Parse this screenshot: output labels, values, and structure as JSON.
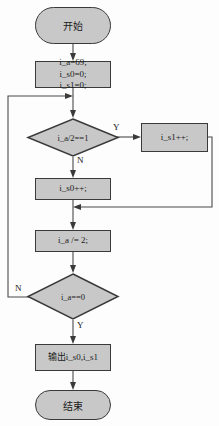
{
  "diagram": {
    "type": "flowchart",
    "title": "",
    "nodes": {
      "start": {
        "label": "开始",
        "shape": "terminator"
      },
      "init": {
        "label": "i_a=69;\ni_s0=0;\ni_s1=0;",
        "shape": "process"
      },
      "decision_bit": {
        "label": "i_a/2==1",
        "shape": "decision"
      },
      "inc_s1": {
        "label": "i_s1++;",
        "shape": "process"
      },
      "inc_s0": {
        "label": "i_s0++;",
        "shape": "process"
      },
      "halve": {
        "label": "i_a /= 2;",
        "shape": "process"
      },
      "decision_zero": {
        "label": "i_a==0",
        "shape": "decision"
      },
      "output": {
        "label": "输出i_s0,i_s1",
        "shape": "process"
      },
      "end": {
        "label": "结束",
        "shape": "terminator"
      }
    },
    "edge_labels": {
      "bit_yes": "Y",
      "bit_no": "N",
      "zero_no": "N",
      "zero_yes": "Y"
    },
    "colors": {
      "node_fill": "#c8c8c8",
      "node_border": "#3a3a3a",
      "wire": "#4a4a4a",
      "text": "#1a1a1a",
      "background": "#fdfdfd"
    }
  }
}
